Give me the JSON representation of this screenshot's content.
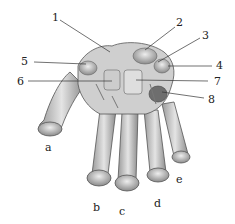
{
  "figure": {
    "numbered_labels": [
      "1",
      "2",
      "3",
      "4",
      "5",
      "6",
      "7",
      "8"
    ],
    "letter_labels": [
      "a",
      "b",
      "c",
      "d",
      "e"
    ],
    "colors": {
      "bone_fill": "#d9d9d9",
      "bone_shade": "#8a8a8a",
      "outline": "#555555",
      "leader_line": "#333333"
    }
  }
}
